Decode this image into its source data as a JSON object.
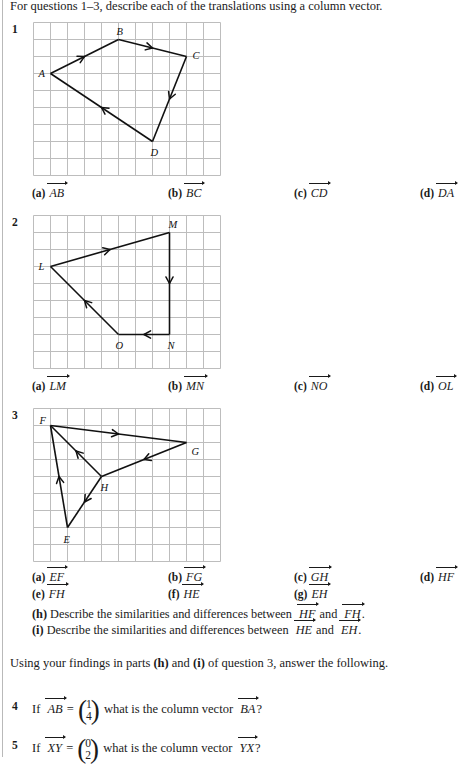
{
  "header": {
    "instruction": "For questions 1–3, describe each of the translations using a column vector."
  },
  "grid": {
    "cell": 17,
    "cols": 11,
    "rows": 9,
    "line_color": "#bdbdbd",
    "stroke_color": "#111111"
  },
  "questions": [
    {
      "number": "1",
      "shape": {
        "points": {
          "A": [
            1,
            3
          ],
          "B": [
            5,
            1
          ],
          "C": [
            9,
            2
          ],
          "D": [
            7,
            7
          ]
        },
        "labels": [
          {
            "name": "A",
            "dx": -12,
            "dy": 3
          },
          {
            "name": "B",
            "dx": -2,
            "dy": -5
          },
          {
            "name": "C",
            "dx": 6,
            "dy": 2
          },
          {
            "name": "D",
            "dx": -2,
            "dy": 14
          }
        ],
        "segments": [
          {
            "from": "A",
            "to": "B"
          },
          {
            "from": "B",
            "to": "C"
          },
          {
            "from": "C",
            "to": "D"
          },
          {
            "from": "D",
            "to": "A"
          }
        ]
      },
      "answers": [
        {
          "tag": "(a)",
          "vector": "AB"
        },
        {
          "tag": "(b)",
          "vector": "BC"
        },
        {
          "tag": "(c)",
          "vector": "CD"
        },
        {
          "tag": "(d)",
          "vector": "DA"
        }
      ]
    },
    {
      "number": "2",
      "shape": {
        "points": {
          "L": [
            1,
            3
          ],
          "M": [
            8,
            1
          ],
          "N": [
            8,
            7
          ],
          "O": [
            5,
            7
          ]
        },
        "labels": [
          {
            "name": "L",
            "dx": -12,
            "dy": 3
          },
          {
            "name": "M",
            "dx": -1,
            "dy": -5
          },
          {
            "name": "N",
            "dx": -2,
            "dy": 14
          },
          {
            "name": "O",
            "dx": -3,
            "dy": 14
          }
        ],
        "segments": [
          {
            "from": "L",
            "to": "M"
          },
          {
            "from": "M",
            "to": "N"
          },
          {
            "from": "N",
            "to": "O"
          },
          {
            "from": "O",
            "to": "L"
          }
        ]
      },
      "answers": [
        {
          "tag": "(a)",
          "vector": "LM"
        },
        {
          "tag": "(b)",
          "vector": "MN"
        },
        {
          "tag": "(c)",
          "vector": "NO"
        },
        {
          "tag": "(d)",
          "vector": "OL"
        }
      ]
    },
    {
      "number": "3",
      "shape": {
        "points": {
          "E": [
            2,
            7
          ],
          "F": [
            1,
            1
          ],
          "G": [
            9,
            2
          ],
          "H": [
            4,
            4
          ]
        },
        "labels": [
          {
            "name": "F",
            "dx": -11,
            "dy": -2
          },
          {
            "name": "G",
            "dx": 5,
            "dy": 12
          },
          {
            "name": "H",
            "dx": -1,
            "dy": 14
          },
          {
            "name": "E",
            "dx": -4,
            "dy": 15
          }
        ],
        "segments": [
          {
            "from": "E",
            "to": "F"
          },
          {
            "from": "F",
            "to": "G"
          },
          {
            "from": "G",
            "to": "H"
          },
          {
            "from": "H",
            "to": "F"
          },
          {
            "from": "H",
            "to": "E"
          }
        ]
      },
      "answers": [
        {
          "tag": "(a)",
          "vector": "EF"
        },
        {
          "tag": "(b)",
          "vector": "FG"
        },
        {
          "tag": "(c)",
          "vector": "GH"
        },
        {
          "tag": "(d)",
          "vector": "HF"
        },
        {
          "tag": "(e)",
          "vector": "FH"
        },
        {
          "tag": "(f)",
          "vector": "HE"
        },
        {
          "tag": "(g)",
          "vector": "EH"
        }
      ],
      "descriptions": [
        {
          "tag": "(h)",
          "text_before": "Describe the similarities and differences between",
          "vector_1": "HF",
          "joiner": "and",
          "vector_2": "FH",
          "text_after": "."
        },
        {
          "tag": "(i)",
          "text_before": "Describe the similarities and differences between",
          "vector_1": "HE",
          "joiner": "and",
          "vector_2": "EH",
          "text_after": "."
        }
      ]
    }
  ],
  "using_note": {
    "before": "Using your findings in parts",
    "part_h": "(h)",
    "mid": "and",
    "part_i": "(i)",
    "after": "of question 3, answer the following."
  },
  "final_questions": [
    {
      "number": "4",
      "if_word": "If",
      "given_vector": "AB",
      "equals": "=",
      "column": {
        "top": "1",
        "bottom": "4"
      },
      "middle_text": "what is the column vector",
      "asked_vector": "BA",
      "question_mark": "?"
    },
    {
      "number": "5",
      "if_word": "If",
      "given_vector": "XY",
      "equals": "=",
      "column": {
        "top": "0",
        "bottom": "2"
      },
      "middle_text": "what is the column vector",
      "asked_vector": "YX",
      "question_mark": "?"
    }
  ]
}
